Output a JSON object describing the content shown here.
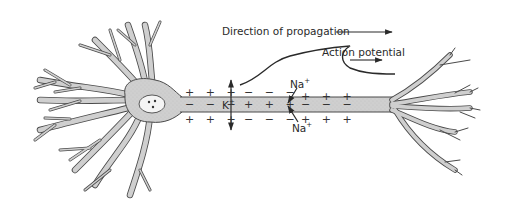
{
  "diagram": {
    "type": "neuron-action-potential",
    "labels": {
      "direction": "Direction of propagation",
      "action_potential": "Action potential",
      "potassium": "K",
      "potassium_charge": "+",
      "sodium_top": "Na",
      "sodium_top_charge": "+",
      "sodium_bottom": "Na",
      "sodium_bottom_charge": "+"
    },
    "charges": {
      "outside_top_left": "+ + +",
      "inside_left": "− − −",
      "outside_bottom_left": "+ + +",
      "outside_top_mid": "− − −",
      "inside_mid": "+ + +",
      "outside_bottom_mid": "− − −",
      "outside_top_right": "+ + +",
      "inside_right": "− − −",
      "outside_bottom_right": "+ + +"
    },
    "colors": {
      "cell_fill": "#cfcfcf",
      "outline": "#4a4a4a",
      "text": "#2a2a2a",
      "background": "#ffffff"
    }
  }
}
